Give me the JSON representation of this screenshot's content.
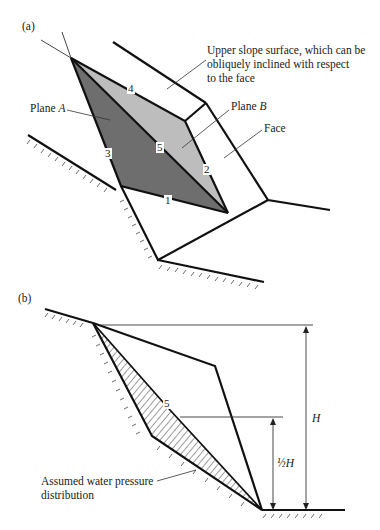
{
  "figure": {
    "part_a": {
      "label": "(a)",
      "annotations": {
        "upper_slope": [
          "Upper slope surface, which can be",
          "obliquely inclined with respect",
          "to the face"
        ],
        "plane_a": "Plane ",
        "plane_a_italic": "A",
        "plane_b": "Plane ",
        "plane_b_italic": "B",
        "face": "Face"
      },
      "line_numbers": [
        "1",
        "2",
        "3",
        "4",
        "5"
      ],
      "colors": {
        "plane_a_fill": "#6e6e6e",
        "plane_b_fill": "#bdbdbd",
        "line": "#111111"
      }
    },
    "part_b": {
      "label": "(b)",
      "annotations": {
        "water_pressure": [
          "Assumed water pressure",
          "distribution"
        ],
        "line_number": "5",
        "height_full": "H",
        "height_half": "½H"
      }
    }
  }
}
